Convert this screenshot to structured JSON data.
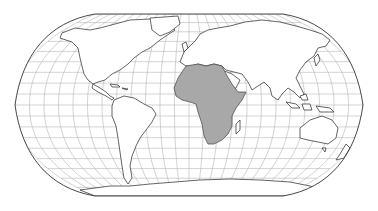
{
  "map": {
    "title": "World map with Africa highlighted",
    "projection": "Robinson",
    "highlighted_region": "Africa",
    "colors": {
      "background": "#ffffff",
      "land": "#ffffff",
      "highlight": "#a8a8a8",
      "coastline": "#222222",
      "graticule": "#b0b0b0",
      "border": "#333333"
    },
    "graticule": {
      "meridian_step_deg": 15,
      "parallel_step_deg": 10
    }
  }
}
